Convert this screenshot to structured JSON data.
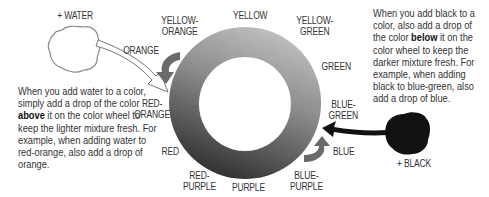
{
  "diagram": {
    "type": "color-wheel",
    "ring_labels": [
      {
        "id": "yellow",
        "text": "YELLOW"
      },
      {
        "id": "yellow-orange",
        "line1": "YELLOW-",
        "line2": "ORANGE"
      },
      {
        "id": "yellow-green",
        "line1": "YELLOW-",
        "line2": "GREEN"
      },
      {
        "id": "orange",
        "text": "ORANGE"
      },
      {
        "id": "green",
        "text": "GREEN"
      },
      {
        "id": "red-orange",
        "line1": "RED-",
        "line2": "ORANGE"
      },
      {
        "id": "blue-green",
        "line1": "BLUE-",
        "line2": "GREEN"
      },
      {
        "id": "red",
        "text": "RED"
      },
      {
        "id": "blue",
        "text": "BLUE"
      },
      {
        "id": "red-purple",
        "line1": "RED-",
        "line2": "PURPLE"
      },
      {
        "id": "purple",
        "text": "PURPLE"
      },
      {
        "id": "blue-purple",
        "line1": "BLUE-",
        "line2": "PURPLE"
      }
    ],
    "water_label": "+ WATER",
    "black_label": "+ BLACK",
    "left_text": {
      "before": "When you add water to a color, simply add a drop of the color ",
      "bold": "above",
      "after": " it on the color wheel to keep the lighter mixture fresh. For example, when adding water to red-orange, also add a drop of orange."
    },
    "right_text": {
      "before": "When you add black to a color, also add a drop of the color ",
      "bold": "below",
      "after": " it on the color wheel to keep the darker mixture fresh. For example, when adding black to blue-green, also add a drop of blue."
    },
    "colors": {
      "ring_light": "#b8b8b8",
      "ring_dark": "#3a3a3a",
      "arrow_gray": "#6a6a6a",
      "black_blob": "#111111"
    }
  }
}
